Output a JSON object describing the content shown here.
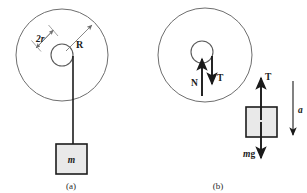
{
  "figure": {
    "panels": [
      {
        "id": "a",
        "caption": "(a)",
        "labels": {
          "axle_diameter": "2r",
          "wheel_radius": "R",
          "block_mass": "m"
        },
        "geometry": {
          "wheel_center_x": 62,
          "wheel_center_y": 55,
          "wheel_radius_px": 46,
          "axle_radius_px": 11,
          "block_x": 56,
          "block_y": 144,
          "block_w": 30,
          "block_h": 30,
          "cord_x": 73,
          "cord_top_y": 56,
          "cord_bottom_y": 144
        }
      },
      {
        "id": "b",
        "caption": "(b)",
        "labels": {
          "normal_force": "N",
          "tension_on_wheel": "T",
          "tension_on_block": "T",
          "weight": "mg",
          "acceleration": "a"
        },
        "geometry": {
          "wheel_center_x": 205,
          "wheel_center_y": 55,
          "wheel_radius_px": 47,
          "axle_radius_px": 11,
          "fbd_block_x": 246,
          "fbd_block_y": 107,
          "fbd_block_w": 31,
          "fbd_block_h": 30
        }
      }
    ],
    "colors": {
      "wheel_stroke": "#6e6e6e",
      "axle_stroke": "#5a5a5a",
      "block_fill": "#e9e9e9",
      "block_stroke": "#1c1c1c",
      "cord": "#1c1c1c",
      "arrow_dark": "#1a1a1a",
      "arrow_gray": "#707070",
      "text": "#1a1a1a",
      "background": "#ffffff"
    }
  }
}
